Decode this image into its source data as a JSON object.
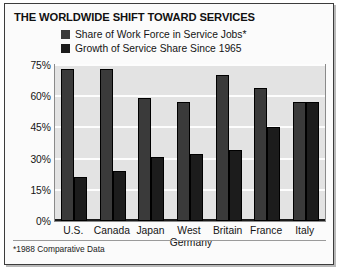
{
  "chart": {
    "title": "THE WORLDWIDE SHIFT TOWARD SERVICES",
    "footnote": "*1988 Comparative Data"
  },
  "legend": {
    "items": [
      {
        "label": "Share of Work Force in Service Jobs*",
        "color": "#3a3a3a",
        "swatch_name": "legend-swatch-service-share"
      },
      {
        "label": "Growth of Service Share Since 1965",
        "color": "#1c1c1c",
        "swatch_name": "legend-swatch-growth"
      }
    ]
  },
  "y_axis": {
    "ticks": [
      "75%",
      "60%",
      "45%",
      "30%",
      "15%",
      "0%"
    ]
  },
  "x_axis": {
    "labels": [
      {
        "line1": "U.S.",
        "line2": ""
      },
      {
        "line1": "Canada",
        "line2": ""
      },
      {
        "line1": "Japan",
        "line2": ""
      },
      {
        "line1": "West",
        "line2": "Germany"
      },
      {
        "line1": "Britain",
        "line2": ""
      },
      {
        "line1": "France",
        "line2": ""
      },
      {
        "line1": "Italy",
        "line2": ""
      }
    ]
  },
  "chart_data": {
    "type": "bar",
    "title": "THE WORLDWIDE SHIFT TOWARD SERVICES",
    "xlabel": "",
    "ylabel": "",
    "ylim": [
      0,
      75
    ],
    "yticks": [
      0,
      15,
      30,
      45,
      60,
      75
    ],
    "ytick_labels": [
      "0%",
      "15%",
      "30%",
      "45%",
      "60%",
      "75%"
    ],
    "grid": true,
    "grid_axis": "y",
    "legend_position": "top",
    "annotations": [
      "*1988 Comparative Data"
    ],
    "categories": [
      "U.S.",
      "Canada",
      "Japan",
      "West Germany",
      "Britain",
      "France",
      "Italy"
    ],
    "series": [
      {
        "name": "Share of Work Force in Service Jobs*",
        "color": "#3a3a3a",
        "values": [
          73,
          73,
          59,
          57,
          70,
          64,
          57
        ]
      },
      {
        "name": "Growth of Service Share Since 1965",
        "color": "#1c1c1c",
        "values": [
          21,
          24,
          31,
          32,
          34,
          45,
          57
        ]
      }
    ]
  }
}
